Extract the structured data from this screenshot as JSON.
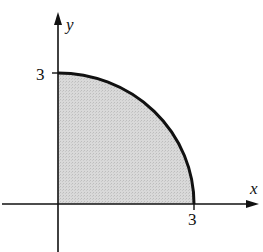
{
  "diagram": {
    "x_axis_label": "x",
    "y_axis_label": "y",
    "x_tick_label": "3",
    "y_tick_label": "3",
    "radius": 3,
    "colors": {
      "fill": "#d6d6d6",
      "stroke": "#111111",
      "background": "#ffffff"
    }
  }
}
